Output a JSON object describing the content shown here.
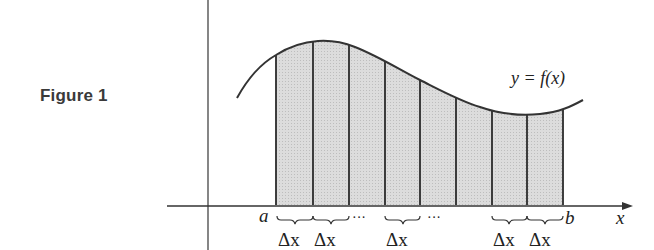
{
  "figure": {
    "caption": "Figure 1",
    "curve_label": "y = f(x)",
    "x_axis_label": "x",
    "left_endpoint_label": "a",
    "right_endpoint_label": "b",
    "delta_label": "Δx",
    "ellipsis": "···",
    "strip_count_shown": 8,
    "colors": {
      "line": "#333333",
      "fill": "#d6d6d6",
      "caption": "#3a3a3a"
    }
  }
}
